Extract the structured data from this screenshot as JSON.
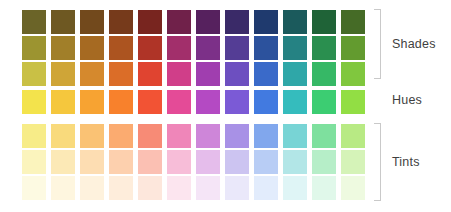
{
  "figure": {
    "background": "#ffffff",
    "label_color": "#3f3f3f",
    "bracket_color": "#c9c9c9"
  },
  "groups": [
    {
      "key": "shades",
      "label": "Shades",
      "rows": 3,
      "has_bracket": true
    },
    {
      "key": "hues",
      "label": "Hues",
      "rows": 1,
      "has_bracket": false
    },
    {
      "key": "tints",
      "label": "Tints",
      "rows": 3,
      "has_bracket": true
    }
  ],
  "chart_data": {
    "type": "heatmap",
    "xlabel": "",
    "ylabel": "",
    "grid": false,
    "legend_position": "right",
    "columns": 12,
    "rows": 7,
    "column_names": [
      "Yellow",
      "Yellow-Orange",
      "Orange",
      "Red-Orange",
      "Red",
      "Red-Violet",
      "Violet",
      "Blue-Violet",
      "Blue",
      "Blue-Green",
      "Green",
      "Yellow-Green"
    ],
    "row_names": [
      "Shade 3 (darkest)",
      "Shade 2",
      "Shade 1",
      "Hue (pure)",
      "Tint 1",
      "Tint 2",
      "Tint 3 (lightest)"
    ],
    "series": [
      {
        "name": "Shade 3 (darkest)",
        "group": "shades",
        "values": [
          "#6b6428",
          "#6e5822",
          "#72491c",
          "#763a1b",
          "#78251f",
          "#70214a",
          "#56215e",
          "#3a2a68",
          "#1f3a6e",
          "#1b5a5c",
          "#1f6337",
          "#456b26"
        ]
      },
      {
        "name": "Shade 2",
        "group": "shades",
        "values": [
          "#9c9430",
          "#a17f29",
          "#a66a22",
          "#ac5420",
          "#af3427",
          "#a22f6b",
          "#7c3088",
          "#543d95",
          "#2c529d",
          "#258283",
          "#2a8f4f",
          "#639b2f"
        ]
      },
      {
        "name": "Shade 1",
        "group": "shades",
        "values": [
          "#c9c045",
          "#cfa537",
          "#d5892d",
          "#db6d28",
          "#e04430",
          "#d03e89",
          "#a03eaf",
          "#6d4fc0",
          "#3a6ac9",
          "#2fa7a8",
          "#36b866",
          "#80c73e"
        ]
      },
      {
        "name": "Hue (pure)",
        "group": "hues",
        "values": [
          "#f3e34c",
          "#f5c73d",
          "#f7a332",
          "#f8812c",
          "#f25334",
          "#e44b97",
          "#b44ac3",
          "#7b5ad6",
          "#427ae0",
          "#35bcbd",
          "#3ccd72",
          "#92de44"
        ]
      },
      {
        "name": "Tint 1",
        "group": "tints",
        "values": [
          "#f7ec88",
          "#f9da7c",
          "#fac274",
          "#fbab70",
          "#f78b76",
          "#ef86b9",
          "#ce86d9",
          "#a891e6",
          "#81a7ed",
          "#78d4d5",
          "#7ee09e",
          "#b8ea84"
        ]
      },
      {
        "name": "Tint 2",
        "group": "tints",
        "values": [
          "#fbf4bd",
          "#fce9b6",
          "#fdddb2",
          "#fdd0ae",
          "#fbc0b3",
          "#f7bdd8",
          "#e5bdeb",
          "#ccc4f1",
          "#b8cdf5",
          "#b2e6e7",
          "#b6eec8",
          "#d5f3b8"
        ]
      },
      {
        "name": "Tint 3 (lightest)",
        "group": "tints",
        "values": [
          "#fdfae2",
          "#fef6df",
          "#fef2dd",
          "#feeddb",
          "#fde7dc",
          "#fce5ef",
          "#f5e5f7",
          "#eae8fa",
          "#e2ecfc",
          "#dff5f6",
          "#e0f8ea",
          "#eefae0"
        ]
      }
    ]
  }
}
